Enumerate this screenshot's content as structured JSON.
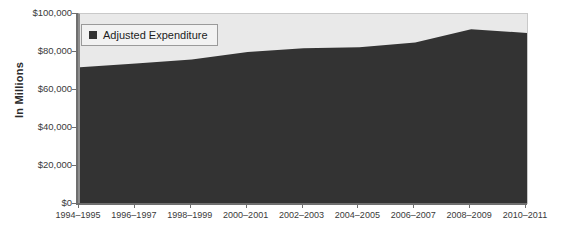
{
  "chart_data": {
    "type": "area",
    "title": "",
    "xlabel": "",
    "ylabel": "In Millions",
    "categories": [
      "1994–1995",
      "1996–1997",
      "1998–1999",
      "2000–2001",
      "2002–2003",
      "2004–2005",
      "2006–2007",
      "2008–2009",
      "2010–2011"
    ],
    "series": [
      {
        "name": "Adjusted Expenditure",
        "color": "#333333",
        "values": [
          72000,
          74000,
          76000,
          80000,
          82000,
          82500,
          85000,
          92000,
          90000
        ]
      }
    ],
    "ylim": [
      0,
      100000
    ],
    "yticks": [
      0,
      20000,
      40000,
      60000,
      80000,
      100000
    ],
    "ytick_labels": [
      "$0",
      "$20,000",
      "$40,000",
      "$60,000",
      "$80,000",
      "$100,000"
    ],
    "grid": false,
    "legend_position": "top-left",
    "plot_background": "#e9e9e9",
    "axis_color": "#6f6f6f"
  },
  "legend": {
    "entries": [
      {
        "label": "Adjusted Expenditure",
        "marker": "square-marker"
      }
    ]
  },
  "axes": {
    "y_title": "In Millions"
  }
}
